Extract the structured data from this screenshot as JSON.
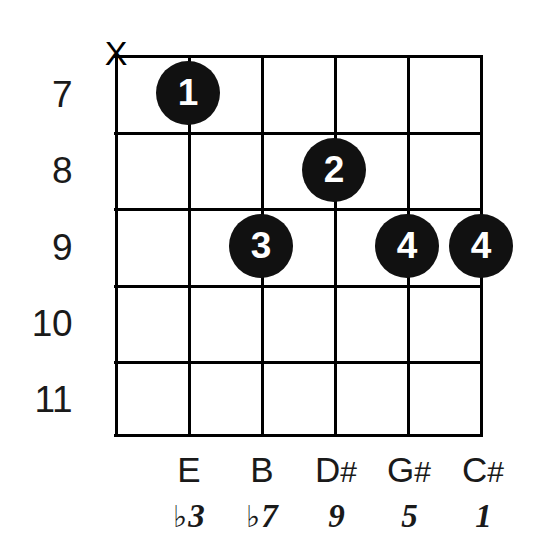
{
  "diagram": {
    "type": "guitar-chord-diagram",
    "strings_count": 6,
    "frets_shown": 5,
    "mute_marker": "X",
    "muted_string_index": 1,
    "colors": {
      "background": "#ffffff",
      "line": "#000000",
      "dot_fill": "#111111",
      "dot_text": "#ffffff",
      "text": "#1a1a1a"
    },
    "fret_labels": [
      "7",
      "8",
      "9",
      "10",
      "11"
    ],
    "dots": [
      {
        "finger": "1",
        "string": 2,
        "fret": 7
      },
      {
        "finger": "2",
        "string": 4,
        "fret": 8
      },
      {
        "finger": "3",
        "string": 3,
        "fret": 9
      },
      {
        "finger": "4",
        "string": 5,
        "fret": 9
      },
      {
        "finger": "4",
        "string": 6,
        "fret": 9
      }
    ],
    "note_names": [
      {
        "letter": "E",
        "accidental": ""
      },
      {
        "letter": "B",
        "accidental": ""
      },
      {
        "letter": "D",
        "accidental": "#"
      },
      {
        "letter": "G",
        "accidental": "#"
      },
      {
        "letter": "C",
        "accidental": "#"
      }
    ],
    "intervals": [
      {
        "accidental": "♭",
        "degree": "3"
      },
      {
        "accidental": "♭",
        "degree": "7"
      },
      {
        "accidental": "",
        "degree": "9"
      },
      {
        "accidental": "",
        "degree": "5"
      },
      {
        "accidental": "",
        "degree": "1"
      }
    ]
  }
}
